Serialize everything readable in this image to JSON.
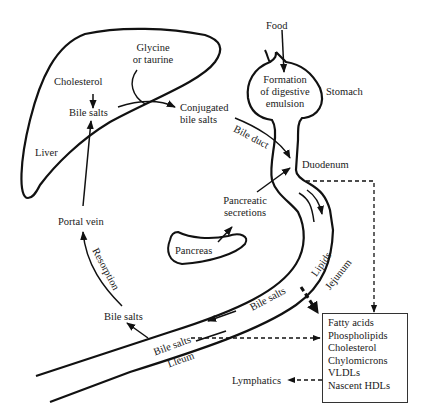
{
  "diagram": {
    "type": "flow",
    "title": "",
    "nodes": {
      "food": "Food",
      "stomach": "Stomach",
      "emulsion": [
        "Formation",
        "of digestive",
        "emulsion"
      ],
      "glycine": [
        "Glycine",
        "or taurine"
      ],
      "cholesterol": "Cholesterol",
      "bile_salts_liver": "Bile salts",
      "conjugated": [
        "Conjugated",
        "bile salts"
      ],
      "liver": "Liver",
      "bile_duct": "Bile duct",
      "duodenum": "Duodenum",
      "pancreatic_secretions": [
        "Pancreatic",
        "secretions"
      ],
      "pancreas": "Pancreas",
      "portal_vein": "Portal vein",
      "resorption": "Resorption",
      "bile_salts_ileum": "Bile salts",
      "bile_salts_lumen_1": "Bile salts",
      "bile_salts_lumen_2": "Bile salts",
      "lleum": "Lleum",
      "lipids": "Lipids",
      "jejunum": "Jejunum",
      "lymphatics": "Lymphatics"
    },
    "products_box": {
      "items": [
        "Fatty acids",
        "Phospholipids",
        "Cholesterol",
        "Chylomicrons",
        "VLDLs",
        "Nascent HDLs"
      ]
    },
    "edges": [
      {
        "from": "Food",
        "to": "Stomach",
        "style": "solid"
      },
      {
        "from": "Cholesterol",
        "to": "Bile salts (liver)",
        "style": "solid"
      },
      {
        "from": "Bile salts (liver)",
        "to": "Conjugated bile salts",
        "via": "Glycine or taurine",
        "style": "solid"
      },
      {
        "from": "Conjugated bile salts",
        "to": "Duodenum",
        "label": "Bile duct",
        "style": "solid"
      },
      {
        "from": "Pancreas",
        "to": "Pancreatic secretions",
        "style": "solid"
      },
      {
        "from": "Pancreatic secretions",
        "to": "Duodenum",
        "style": "solid"
      },
      {
        "from": "Duodenum",
        "to": "Products box",
        "style": "dashed"
      },
      {
        "from": "Jejunum",
        "to": "Products box",
        "style": "dashed-bold"
      },
      {
        "from": "Ileum",
        "to": "Products box",
        "style": "dashed"
      },
      {
        "from": "Products box",
        "to": "Lymphatics",
        "style": "dashed"
      },
      {
        "from": "Bile salts (ileum lumen)",
        "to": "Bile salts (ileum)",
        "style": "solid"
      },
      {
        "from": "Bile salts (ileum)",
        "to": "Portal vein",
        "label": "Resorption",
        "style": "solid"
      },
      {
        "from": "Portal vein",
        "to": "Bile salts (liver)",
        "style": "solid"
      }
    ],
    "colors": {
      "stroke": "#111111",
      "text": "#1a1a1a",
      "background": "#ffffff"
    }
  }
}
